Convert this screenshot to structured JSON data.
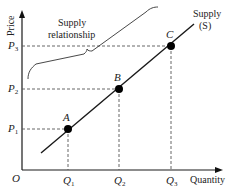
{
  "diagram": {
    "axes": {
      "y_label": "Price",
      "x_label": "Quantity",
      "origin_label": "O"
    },
    "curve": {
      "label_line1": "Supply",
      "label_line2": "(S)"
    },
    "annotation": {
      "line1": "Supply",
      "line2": "relationship"
    },
    "points": [
      {
        "name": "A",
        "price_label": "P",
        "price_sub": "1",
        "qty_label": "Q",
        "qty_sub": "1"
      },
      {
        "name": "B",
        "price_label": "P",
        "price_sub": "2",
        "qty_label": "Q",
        "qty_sub": "2"
      },
      {
        "name": "C",
        "price_label": "P",
        "price_sub": "3",
        "qty_label": "Q",
        "qty_sub": "3"
      }
    ],
    "colors": {
      "line": "#1a1a1a",
      "dash": "#555555",
      "point": "#000000"
    }
  }
}
